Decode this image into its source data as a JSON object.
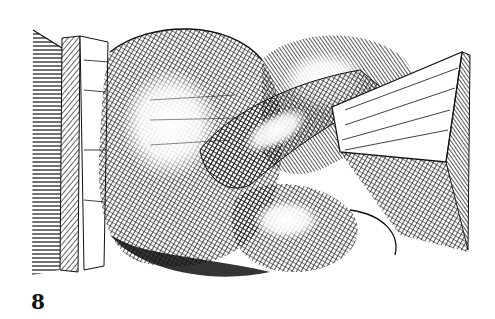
{
  "figure": {
    "label": "8",
    "colors": {
      "ink": "#111111",
      "paper": "#ffffff"
    }
  }
}
